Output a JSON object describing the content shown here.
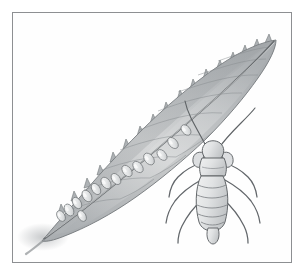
{
  "figure": {
    "domain": "Natural-Image",
    "medium": "graphite pencil illustration",
    "title": "Leaf with insect eggs and adult bug",
    "background_color": "#ffffff",
    "frame": {
      "border_color": "#8d8f92",
      "border_width_px": 1,
      "x": 12,
      "y": 12,
      "width": 280,
      "height": 251,
      "fill_color": "#fefefe"
    },
    "palette": {
      "ink_dark": "#4a4d51",
      "ink_mid": "#6e7276",
      "ink_light": "#9da1a5",
      "leaf_light": "#d3d5d6",
      "leaf_mid": "#b9bcbe",
      "leaf_dark": "#9ea2a5",
      "leaf_shadow": "#8a8e91",
      "egg_fill": "#eceded",
      "egg_shade": "#c2c5c7",
      "body_fill": "#e3e5e6",
      "body_shade": "#c6c9cb",
      "paper": "#fefefe"
    },
    "subjects": [
      {
        "name": "leaf",
        "description": "elongate lanceolate leaf with serrate margin on upper edge, smooth lower edge, prominent diagonal midrib, drawn from lower-left base to upper-right tip",
        "tip_point": [
          268,
          36
        ],
        "base_point": [
          36,
          234
        ],
        "serration_count": 17,
        "vein_count": 11
      },
      {
        "name": "egg-cluster",
        "description": "pale teardrop-shaped insect eggs arranged in a row along the leaf midrib",
        "egg_count": 14
      },
      {
        "name": "adult-bug",
        "description": "aphid-like bug seen from above with two long antennae, segmented abdomen and six jointed legs",
        "position": [
          206,
          185
        ],
        "abdomen_segments": 6,
        "leg_count": 6,
        "antenna_count": 2
      }
    ]
  },
  "leaf_geometry": {
    "outline": "M 36 234 L 48 219 L 60 203 L 74 186 L 90 168 L 108 148 L 128 127 L 150 106 L 172 86 L 196 68 L 220 53 L 242 42 L 262 35 L 270 34 L 268 42 L 262 54 L 252 70 L 238 89 L 222 108 L 204 127 L 184 146 L 162 165 L 140 183 L 118 199 L 96 213 L 74 224 L 54 231 Z",
    "midrib": "M 38 232 C 70 210 110 178 152 142 C 194 106 236 70 266 36",
    "serrations": [
      [
        266,
        35,
        262,
        28
      ],
      [
        254,
        40,
        250,
        32
      ],
      [
        242,
        46,
        238,
        38
      ],
      [
        230,
        53,
        226,
        45
      ],
      [
        217,
        61,
        213,
        53
      ],
      [
        204,
        70,
        199,
        62
      ],
      [
        191,
        80,
        186,
        72
      ],
      [
        178,
        91,
        173,
        83
      ],
      [
        164,
        103,
        159,
        95
      ],
      [
        151,
        115,
        146,
        107
      ],
      [
        138,
        127,
        133,
        119
      ],
      [
        124,
        140,
        119,
        132
      ],
      [
        111,
        153,
        106,
        145
      ],
      [
        98,
        166,
        93,
        158
      ],
      [
        85,
        179,
        80,
        171
      ],
      [
        72,
        192,
        67,
        184
      ],
      [
        59,
        205,
        54,
        197
      ]
    ],
    "veins": [
      "M 60 204 C 74 200 92 196 108 196",
      "M 78 183 C 96 178 118 174 140 175",
      "M 96 163 C 116 157 142 152 166 154",
      "M 114 143 C 136 136 164 130 190 132",
      "M 133 123 C 156 115 186 108 212 110",
      "M 152 104 C 176 96 206 89 232 90",
      "M 172 85 C 196 78 224 71 248 72",
      "M 192 68 C 214 62 238 56 258 56",
      "M 212 54 C 230 49 248 44 262 43",
      "M 108 196 C 120 192 132 186 142 178",
      "M 140 175 C 152 170 166 162 176 154"
    ]
  },
  "egg_geometry": {
    "eggs": [
      {
        "x": 180,
        "y": 123,
        "rx": 4.0,
        "ry": 6.0,
        "rot": -42
      },
      {
        "x": 167,
        "y": 136,
        "rx": 4.2,
        "ry": 6.4,
        "rot": -42
      },
      {
        "x": 156,
        "y": 148,
        "rx": 4.0,
        "ry": 6.2,
        "rot": -40
      },
      {
        "x": 143,
        "y": 152,
        "rx": 4.4,
        "ry": 6.6,
        "rot": -38
      },
      {
        "x": 132,
        "y": 160,
        "rx": 4.2,
        "ry": 6.4,
        "rot": -40
      },
      {
        "x": 121,
        "y": 164,
        "rx": 4.2,
        "ry": 6.4,
        "rot": -38
      },
      {
        "x": 110,
        "y": 172,
        "rx": 4.0,
        "ry": 6.2,
        "rot": -36
      },
      {
        "x": 100,
        "y": 176,
        "rx": 4.2,
        "ry": 6.4,
        "rot": -36
      },
      {
        "x": 90,
        "y": 182,
        "rx": 4.0,
        "ry": 6.2,
        "rot": -34
      },
      {
        "x": 81,
        "y": 189,
        "rx": 4.2,
        "ry": 6.4,
        "rot": -34
      },
      {
        "x": 71,
        "y": 196,
        "rx": 4.0,
        "ry": 6.2,
        "rot": -32
      },
      {
        "x": 63,
        "y": 203,
        "rx": 4.2,
        "ry": 6.4,
        "rot": -30
      },
      {
        "x": 55,
        "y": 209,
        "rx": 3.8,
        "ry": 5.8,
        "rot": -30
      },
      {
        "x": 76,
        "y": 209,
        "rx": 3.8,
        "ry": 5.8,
        "rot": -30
      }
    ]
  },
  "bug_geometry": {
    "center": [
      206,
      188
    ],
    "head": "M 200 150 C 196 146 196 140 200 137 C 203 134 209 134 212 137 C 216 140 216 146 212 150 Z",
    "thorax": "M 196 150 C 194 157 194 163 196 168 L 217 168 C 219 163 219 157 217 150 Z",
    "abdomen": "M 195 168 C 190 180 190 200 194 215 C 198 226 214 226 218 215 C 222 200 222 180 217 168 Z",
    "abdomen_segment_lines": [
      "M 193 178 C 202 181 212 181 219 178",
      "M 192 188 C 201 191 212 191 220 188",
      "M 192 198 C 201 201 212 201 220 198",
      "M 193 207 C 202 210 212 210 219 207",
      "M 196 215 C 203 218 211 218 217 215"
    ],
    "cauda": "M 202 222 C 200 230 204 236 207 236 C 210 236 214 230 212 222 Z",
    "antennae": [
      "M 201 140 C 196 131 190 122 185 112 C 182 106 180 100 179 95",
      "M 212 140 C 218 132 226 124 234 116 C 240 110 245 105 248 101"
    ],
    "cornicles": [
      "M 197 146 C 191 144 187 148 188 154 C 189 158 193 160 195 158",
      "M 216 146 C 222 144 226 148 225 154 C 224 158 220 160 218 158"
    ],
    "legs": [
      "M 196 156 C 188 158 179 163 172 170 C 167 175 164 182 163 189",
      "M 195 172 C 186 177 176 184 169 193 C 164 200 161 208 160 215",
      "M 196 192 C 188 199 181 208 176 218 C 173 224 172 230 172 235",
      "M 217 156 C 225 158 234 163 241 170 C 246 175 249 182 250 189",
      "M 218 172 C 227 177 237 184 244 193 C 249 200 252 208 253 215",
      "M 217 192 C 225 199 232 208 237 218 C 240 224 241 230 241 235"
    ]
  }
}
